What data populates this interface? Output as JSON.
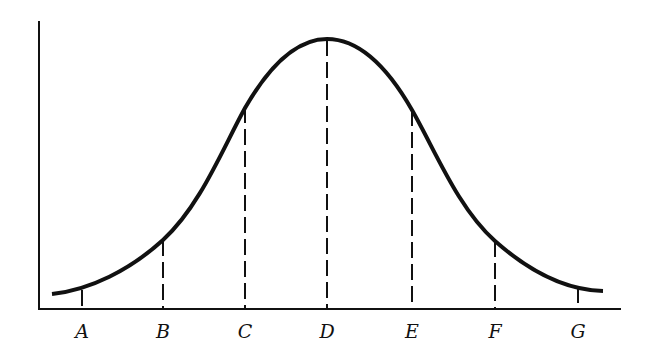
{
  "diagram": {
    "type": "normal-distribution-curve",
    "x_labels": [
      "A",
      "B",
      "C",
      "D",
      "E",
      "F",
      "G"
    ],
    "colors": {
      "stroke": "#111111",
      "background": "#ffffff"
    }
  }
}
